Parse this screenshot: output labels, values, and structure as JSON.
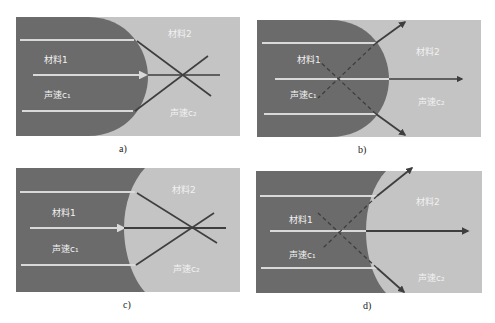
{
  "colors": {
    "material1": "#6b6b6b",
    "material2": "#c4c4c4",
    "incident_ray": "#d9d9d9",
    "refracted_ray": "#3e3e3e",
    "label_text": "#f2f2f2"
  },
  "panels": [
    {
      "id": "a",
      "caption": "a)",
      "material1_label": "材料1",
      "material2_label": "材料2",
      "speed1_label": "声速c₁",
      "speed2_label": "声速c₂",
      "interface": "convex lens of material 1 bulging into material 2",
      "ray_behavior": "converging (real focus in material 2)"
    },
    {
      "id": "b",
      "caption": "b)",
      "material1_label": "材料1",
      "material2_label": "材料2",
      "speed1_label": "声速c₁",
      "speed2_label": "声速c₂",
      "interface": "convex lens of material 1 bulging into material 2",
      "ray_behavior": "diverging (virtual focus in material 1, dashed)"
    },
    {
      "id": "c",
      "caption": "c)",
      "material1_label": "材料1",
      "material2_label": "材料2",
      "speed1_label": "声速c₁",
      "speed2_label": "声速c₂",
      "interface": "concave surface (material 2 bulging into material 1)",
      "ray_behavior": "converging (real focus in material 2)"
    },
    {
      "id": "d",
      "caption": "d)",
      "material1_label": "材料1",
      "material2_label": "材料2",
      "speed1_label": "声速c₁",
      "speed2_label": "声速c₂",
      "interface": "concave surface (material 2 bulging into material 1)",
      "ray_behavior": "diverging (virtual focus in material 1, dashed)"
    }
  ]
}
